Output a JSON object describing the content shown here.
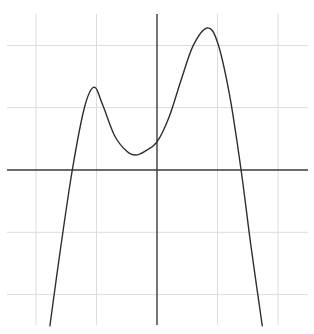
{
  "chart_data": {
    "type": "line",
    "title": "",
    "xlabel": "",
    "ylabel": "",
    "grid": true,
    "legend": null,
    "xlim": [
      -2.5,
      2.5
    ],
    "ylim": [
      -2.5,
      2.5
    ],
    "xticks_grid": [
      -2,
      -1,
      0,
      1,
      2
    ],
    "yticks_grid": [
      -2,
      -1,
      0,
      1,
      2
    ],
    "tick_labels_visible": false,
    "colors": {
      "curve": "#2e2e2e",
      "axis": "#3a3a3a",
      "grid": "#dcdcdc",
      "background": "#ffffff"
    },
    "series": [
      {
        "name": "f(x)",
        "description": "Quartic-like curve: two local maxima, one local minimum, tends to -infinity at both ends",
        "x": [
          -1.77,
          -1.6,
          -1.4,
          -1.2,
          -1.04,
          -0.9,
          -0.7,
          -0.5,
          -0.35,
          -0.2,
          0.0,
          0.2,
          0.4,
          0.6,
          0.83,
          1.0,
          1.2,
          1.39,
          1.55,
          1.74
        ],
        "y": [
          -2.5,
          -1.3,
          0.0,
          1.0,
          1.33,
          1.05,
          0.55,
          0.3,
          0.24,
          0.3,
          0.45,
          0.85,
          1.45,
          2.0,
          2.28,
          2.05,
          1.2,
          0.0,
          -1.2,
          -2.5
        ]
      }
    ],
    "key_points": {
      "left_x_intercept": [
        -1.4,
        0
      ],
      "local_max_left": [
        -1.04,
        1.33
      ],
      "local_min": [
        -0.35,
        0.24
      ],
      "y_intercept": [
        0,
        0.45
      ],
      "global_max": [
        0.83,
        2.28
      ],
      "right_x_intercept": [
        1.39,
        0
      ]
    }
  },
  "layout": {
    "origin_px": [
      157,
      170
    ],
    "unit_px_x": 60.5,
    "unit_px_y": 62.3,
    "plot_left_px": 7,
    "plot_right_px": 308,
    "plot_top_px": 14,
    "plot_bottom_px": 325
  }
}
